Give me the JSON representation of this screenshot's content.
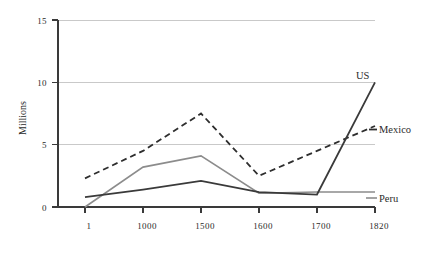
{
  "chart_data": {
    "type": "line",
    "title": "",
    "xlabel": "",
    "ylabel": "Millions",
    "categories": [
      "1",
      "1000",
      "1500",
      "1600",
      "1700",
      "1820"
    ],
    "ylim": [
      0,
      15
    ],
    "yticks": [
      0,
      5,
      10,
      15
    ],
    "ytick_labels": [
      "0",
      "5",
      "10",
      "15"
    ],
    "grid": "horizontal",
    "legend_position": "right-inline",
    "series": [
      {
        "name": "US",
        "values": [
          0.8,
          1.4,
          2.1,
          1.2,
          1.0,
          10.0
        ],
        "color": "#3a3a3a",
        "style": "solid",
        "width": 1.8
      },
      {
        "name": "Mexico",
        "values": [
          2.3,
          4.5,
          7.5,
          2.5,
          4.5,
          6.5
        ],
        "color": "#2e2e2e",
        "style": "dashed",
        "width": 1.8
      },
      {
        "name": "Peru",
        "values": [
          0.0,
          3.2,
          4.1,
          1.1,
          1.2,
          1.2
        ],
        "color": "#8c8c8c",
        "style": "solid",
        "width": 1.6
      }
    ]
  },
  "labels": {
    "y_axis_title": "Millions",
    "series_us": "US",
    "series_mexico": "Mexico",
    "series_peru": "Peru",
    "y_0": "0",
    "y_5": "5",
    "y_10": "10",
    "y_15": "15",
    "x_1": "1",
    "x_1000": "1000",
    "x_1500": "1500",
    "x_1600": "1600",
    "x_1700": "1700",
    "x_1820": "1820"
  }
}
